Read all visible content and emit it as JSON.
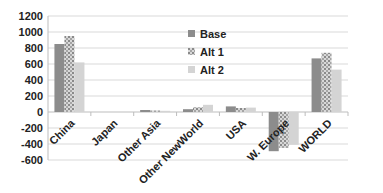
{
  "chart_data": {
    "type": "bar",
    "title": "",
    "xlabel": "",
    "ylabel": "",
    "ylim": [
      -600,
      1200
    ],
    "yticks": [
      1200,
      1000,
      800,
      600,
      400,
      200,
      0,
      -200,
      -400,
      -600
    ],
    "grid": true,
    "legend_position": "inside-top-center",
    "categories": [
      "China",
      "Japan",
      "Other Asia",
      "Other NewWorld",
      "USA",
      "W. Europe",
      "WORLD"
    ],
    "series": [
      {
        "name": "Base",
        "color": "#8c8c8c",
        "pattern": "solid",
        "values": [
          850,
          0,
          25,
          35,
          70,
          -490,
          670
        ]
      },
      {
        "name": "Alt 1",
        "color": "#b0b0b0",
        "pattern": "checker",
        "values": [
          950,
          0,
          20,
          60,
          50,
          -450,
          740
        ]
      },
      {
        "name": "Alt 2",
        "color": "#d4d4d4",
        "pattern": "solid",
        "values": [
          620,
          0,
          15,
          90,
          55,
          -410,
          530
        ]
      }
    ]
  }
}
